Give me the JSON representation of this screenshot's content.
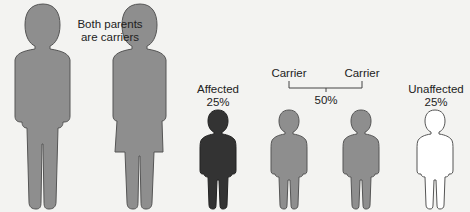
{
  "parents": {
    "label_line1": "Both parents",
    "label_line2": "are carriers",
    "figures": [
      {
        "sex": "male",
        "status": "carrier"
      },
      {
        "sex": "female",
        "status": "carrier"
      }
    ]
  },
  "children": [
    {
      "status_label": "Affected",
      "percent": "25%"
    },
    {
      "status_label": "Carrier"
    },
    {
      "status_label": "Carrier"
    },
    {
      "status_label": "Unaffected",
      "percent": "25%"
    }
  ],
  "carrier_group_percent": "50%",
  "colors": {
    "carrier": "#8e8e8e",
    "affected": "#333333",
    "unaffected": "#ffffff",
    "outline": "#555555",
    "background": "#f3f3f1"
  }
}
